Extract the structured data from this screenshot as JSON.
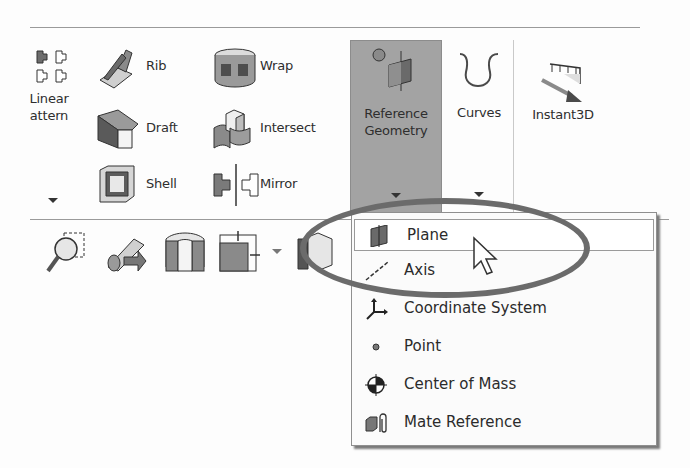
{
  "ribbon": {
    "linear_pattern": {
      "line1": "Linear",
      "line2": "Pattern",
      "visible_line1": "Linear",
      "visible_line2": "attern"
    },
    "rib": "Rib",
    "wrap": "Wrap",
    "draft": "Draft",
    "intersect": "Intersect",
    "shell": "Shell",
    "mirror": "Mirror",
    "reference_geometry": {
      "line1": "Reference",
      "line2": "Geometry"
    },
    "curves": "Curves",
    "instant3d": "Instant3D"
  },
  "dropdown_menu": {
    "items": [
      {
        "label": "Plane",
        "icon": "plane-icon",
        "highlighted": true
      },
      {
        "label": "Axis",
        "icon": "axis-icon"
      },
      {
        "label": "Coordinate System",
        "icon": "coordinate-system-icon"
      },
      {
        "label": "Point",
        "icon": "point-icon"
      },
      {
        "label": "Center of Mass",
        "icon": "center-of-mass-icon"
      },
      {
        "label": "Mate Reference",
        "icon": "mate-reference-icon"
      }
    ]
  },
  "lower_toolbar": {
    "icons": [
      "zoom-to-area-icon",
      "previous-view-icon",
      "section-view-icon",
      "view-orientation-icon",
      "display-style-icon"
    ]
  },
  "colors": {
    "selected_button_bg": "#a3a3a3",
    "callout_ellipse": "#6b6b6b"
  }
}
